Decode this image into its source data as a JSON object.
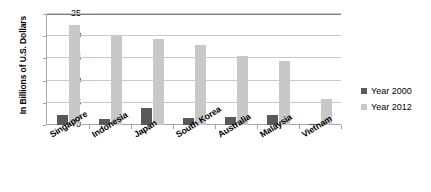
{
  "chart_data": {
    "type": "bar",
    "title": "",
    "xlabel": "",
    "ylabel": "In Billions of U.S. Dollars",
    "ylim": [
      0,
      25
    ],
    "yticks": [
      "0",
      "5",
      "10",
      "15",
      "20",
      "25"
    ],
    "grid": true,
    "legend_position": "right",
    "categories": [
      "Singapore",
      "Indonesia",
      "Japan",
      "South Korea",
      "Australia",
      "Malaysia",
      "Vietnam"
    ],
    "series": [
      {
        "name": "Year 2000",
        "color": "#595959",
        "values": [
          2.3,
          1.3,
          3.9,
          1.6,
          1.7,
          2.2,
          0.2
        ]
      },
      {
        "name": "Year 2012",
        "color": "#c8c8c8",
        "values": [
          22.5,
          20.1,
          19.3,
          18.0,
          15.5,
          14.4,
          5.9
        ]
      }
    ]
  },
  "legend": {
    "items": [
      {
        "label": "Year 2000",
        "color": "#595959"
      },
      {
        "label": "Year 2012",
        "color": "#c8c8c8"
      }
    ]
  }
}
